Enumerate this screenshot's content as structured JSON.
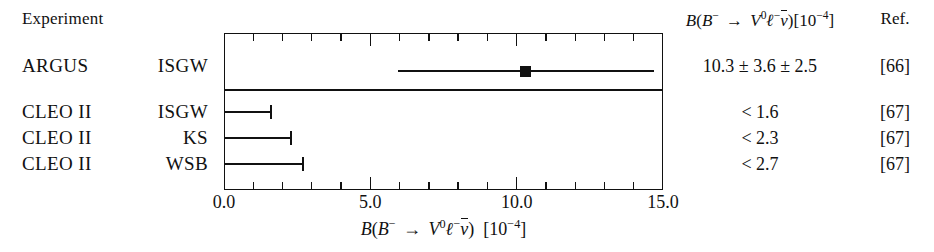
{
  "header": {
    "experiment_label": "Experiment",
    "value_header": "B(B⁻ → V⁰ℓ⁻ν̄)[10⁻⁴]",
    "ref_header": "Ref."
  },
  "rows": [
    {
      "experiment": "ARGUS",
      "model": "ISGW",
      "value": "10.3 ± 3.6 ± 2.5",
      "ref": "[66]"
    },
    {
      "experiment": "CLEO II",
      "model": "ISGW",
      "value": "< 1.6",
      "ref": "[67]"
    },
    {
      "experiment": "CLEO II",
      "model": "KS",
      "value": "< 2.3",
      "ref": "[67]"
    },
    {
      "experiment": "CLEO II",
      "model": "WSB",
      "value": "< 2.7",
      "ref": "[67]"
    }
  ],
  "axis": {
    "title": "B(B⁻ → V⁰ℓ⁻ν̄)  [10⁻⁴]",
    "tick_labels": [
      "0.0",
      "5.0",
      "10.0",
      "15.0"
    ]
  },
  "colors": {
    "ink": "#111111",
    "background": "#ffffff"
  },
  "chart_data": {
    "type": "scatter",
    "title": "",
    "subtitle": "",
    "xlabel": "B(B⁻ → V⁰ℓ⁻ν̄)  [10⁻⁴]",
    "ylabel": "",
    "xlim": [
      0.0,
      15.0
    ],
    "xticks": [
      0.0,
      5.0,
      10.0,
      15.0
    ],
    "xtick_labels": [
      "0.0",
      "5.0",
      "10.0",
      "15.0"
    ],
    "minor_tick_interval": 1.0,
    "grid": false,
    "legend": "none",
    "orientation": "horizontal",
    "categories": [
      "ARGUS ISGW",
      "CLEO II ISGW",
      "CLEO II KS",
      "CLEO II WSB"
    ],
    "points": [
      {
        "label": "ARGUS ISGW",
        "kind": "measurement",
        "value": 10.3,
        "stat_error": 3.6,
        "syst_error": 2.5,
        "total_error": 4.38,
        "error_low": 5.95,
        "error_high": 14.7,
        "marker": "filled-square",
        "text": "10.3 ± 3.6 ± 2.5",
        "ref": "[66]"
      },
      {
        "label": "CLEO II ISGW",
        "kind": "upper-limit",
        "value": 1.6,
        "marker": "limit-bar",
        "text": "< 1.6",
        "ref": "[67]"
      },
      {
        "label": "CLEO II KS",
        "kind": "upper-limit",
        "value": 2.3,
        "marker": "limit-bar",
        "text": "< 2.3",
        "ref": "[67]"
      },
      {
        "label": "CLEO II WSB",
        "kind": "upper-limit",
        "value": 2.7,
        "marker": "limit-bar",
        "text": "< 2.7",
        "ref": "[67]"
      }
    ]
  }
}
